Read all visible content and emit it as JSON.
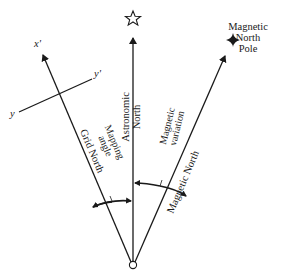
{
  "diagram": {
    "colors": {
      "ink": "#1a1a1a",
      "background": "#ffffff"
    },
    "origin": {
      "x": 133,
      "y": 265
    },
    "lines": {
      "astronomic_north": {
        "label_line1": "Astronomic",
        "label_line2": "North",
        "symbol": "star-outline"
      },
      "grid_north": {
        "label": "Grid North",
        "axis_label": "x'"
      },
      "magnetic_north": {
        "label": "Magnetic North",
        "pole_label_line1": "Magnetic",
        "pole_label_line2": "North",
        "pole_label_line3": "Pole",
        "symbol": "four-point-star"
      }
    },
    "cross_axis": {
      "label_start": "y",
      "label_end": "y'"
    },
    "angles": {
      "mapping_angle": {
        "label_line1": "Mapping",
        "label_line2": "angle"
      },
      "magnetic_variation": {
        "label_line1": "Magnetic",
        "label_line2": "variation"
      }
    }
  }
}
